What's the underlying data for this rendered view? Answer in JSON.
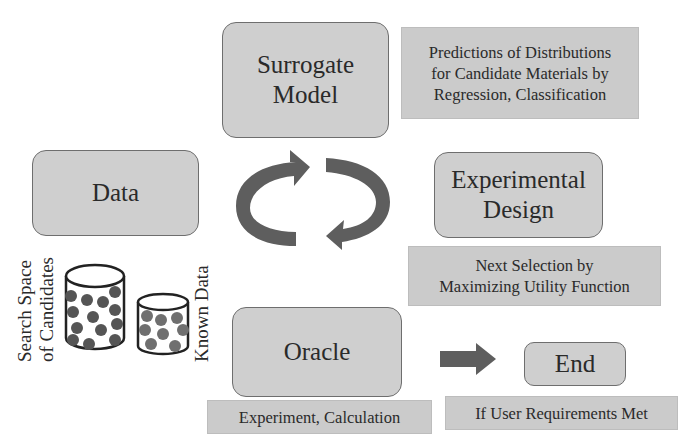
{
  "diagram": {
    "title_fragment": "",
    "nodes": {
      "surrogate_model": {
        "lines": [
          "Surrogate",
          "Model"
        ]
      },
      "data": {
        "label": "Data"
      },
      "experimental_design": {
        "lines": [
          "Experimental",
          "Design"
        ]
      },
      "oracle": {
        "label": "Oracle"
      },
      "end": {
        "label": "End"
      }
    },
    "notes": {
      "surrogate": {
        "lines": [
          "Predictions of Distributions",
          "for Candidate Materials by",
          "Regression, Classification"
        ]
      },
      "design": {
        "lines": [
          "Next Selection by",
          "Maximizing Utility Function"
        ]
      },
      "oracle": {
        "label": "Experiment, Calculation"
      },
      "end": {
        "label": "If User Requirements Met"
      }
    },
    "data_labels": {
      "search_space": {
        "lines": [
          "Search Space",
          "of Candidates"
        ]
      },
      "known_data": {
        "label": "Known Data"
      }
    },
    "icons": {
      "cycle": "cycle-arrows-icon",
      "to_end": "right-arrow-icon",
      "candidates_db": "cylinder-database-icon",
      "known_db": "cylinder-database-icon"
    },
    "colors": {
      "node_fill": "#cfcfcf",
      "node_border": "#6e6e6e",
      "note_fill": "#cbcbcb",
      "arrow": "#5e5e5e",
      "dot_dark": "#555555",
      "dot_light": "#6f6f6f"
    }
  }
}
